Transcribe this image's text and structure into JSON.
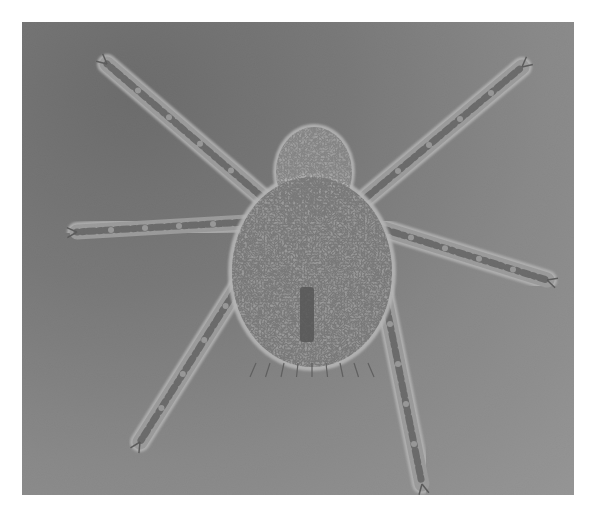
{
  "image": {
    "kind": "phase-contrast micrograph",
    "subject": "mite (arachnid) dorsal view",
    "colors": {
      "background_dark": "#4e4e4e",
      "background_light": "#a9a9a9",
      "body_fill": "#b5b5b5",
      "outline": "#f2f2f2",
      "speckle": "#2a2a2a",
      "border": "#ffffff"
    },
    "body": {
      "cx": 290,
      "cy": 250,
      "rx": 80,
      "ry": 95
    },
    "gnathosoma": {
      "cx": 292,
      "cy": 150,
      "rx": 38,
      "ry": 45
    },
    "legs": [
      {
        "name": "leg-left-1",
        "x1": 240,
        "y1": 175,
        "x2": 85,
        "y2": 42
      },
      {
        "name": "leg-right-1",
        "x1": 345,
        "y1": 175,
        "x2": 500,
        "y2": 45
      },
      {
        "name": "leg-left-2",
        "x1": 225,
        "y1": 200,
        "x2": 55,
        "y2": 210
      },
      {
        "name": "leg-right-2",
        "x1": 355,
        "y1": 205,
        "x2": 525,
        "y2": 258
      },
      {
        "name": "leg-left-3",
        "x1": 225,
        "y1": 250,
        "x2": 118,
        "y2": 420
      },
      {
        "name": "leg-right-3",
        "x1": 360,
        "y1": 262,
        "x2": 400,
        "y2": 462
      }
    ],
    "anal_mark": {
      "x": 278,
      "y": 265,
      "w": 14,
      "h": 55
    }
  }
}
